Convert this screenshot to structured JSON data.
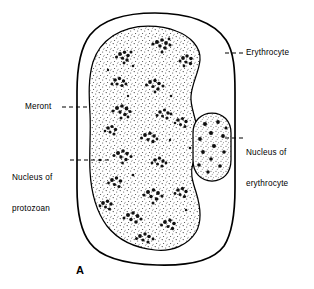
{
  "figure": {
    "panel_letter": "A",
    "background_color": "#ffffff",
    "ink_color": "#000000",
    "width": 314,
    "height": 289
  },
  "labels": {
    "erythrocyte": "Erythrocyte",
    "meront": "Meront",
    "nucleus_of_protozoan_line1": "Nucleus of",
    "nucleus_of_protozoan_line2": "protozoan",
    "nucleus_of_erythrocyte_line1": "Nucleus of",
    "nucleus_of_erythrocyte_line2": "erythrocyte"
  },
  "diagram_data": {
    "type": "biological-line-drawing",
    "subject": "Meront of a protozoan parasite within an erythrocyte",
    "structures": [
      {
        "name": "erythrocyte",
        "shape": "rounded-rectangle-cell-outline",
        "bbox": [
          77,
          13,
          158,
          252
        ],
        "fill": "none",
        "stroke": "#000000",
        "stroke_width": 1.6
      },
      {
        "name": "meront",
        "shape": "lobed-ovoid-indented-right",
        "bbox": [
          88,
          26,
          106,
          228
        ],
        "fill": "stippled",
        "stroke": "#000000",
        "stroke_width": 1.2
      },
      {
        "name": "nucleus-of-erythrocyte",
        "shape": "rounded-oval",
        "bbox": [
          193,
          113,
          39,
          68
        ],
        "fill": "stippled-with-dark-granules",
        "stroke": "#000000",
        "stroke_width": 1.2,
        "granule_count": 13
      },
      {
        "name": "nuclei-of-protozoan",
        "shape": "clustered-rosettes",
        "cluster_count": 19,
        "description": "dark irregular merozoite nuclei grouped in rosettes throughout the meront cytoplasm"
      }
    ],
    "leader_lines": [
      {
        "label": "erythrocyte",
        "style": "dashed",
        "from": [
          243,
          53
        ],
        "to": [
          224,
          53
        ]
      },
      {
        "label": "meront",
        "style": "dashed",
        "from": [
          62,
          107
        ],
        "to": [
          89,
          107
        ]
      },
      {
        "label": "nucleus_of_protozoan",
        "style": "dashed",
        "from": [
          70,
          160
        ],
        "to": [
          110,
          160
        ]
      },
      {
        "label": "nucleus_of_erythrocyte",
        "style": "dashed",
        "from": [
          243,
          138
        ],
        "to": [
          222,
          138
        ]
      }
    ]
  }
}
